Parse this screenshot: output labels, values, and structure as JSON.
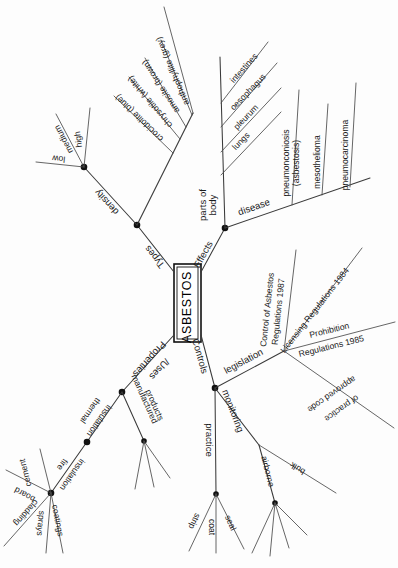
{
  "diagram": {
    "type": "mind-map",
    "title": "ASBESTOS",
    "orientation_note": "rotated-90-clockwise",
    "center": {
      "label": "ASBESTOS"
    },
    "main_branches": [
      {
        "id": "types",
        "label": "Types"
      },
      {
        "id": "effects",
        "label": "Effects"
      },
      {
        "id": "properties",
        "label": "Properties\n/Uses"
      },
      {
        "id": "controls",
        "label": "Controls"
      }
    ],
    "labels": {
      "types": "Types",
      "effects": "Effects",
      "properties_line1": "Properties",
      "properties_line2": "/Uses",
      "controls": "Controls",
      "density": "density",
      "low": "low",
      "medium": "medium",
      "high": "high",
      "crocidolite": "crocidolite (blue)",
      "chrysotile": "chrysotile (white)",
      "amosite": "amosite (brown)",
      "anthophyllite": "anthophyllite (grey)",
      "parts_of_body_line1": "parts of",
      "parts_of_body_line2": "body",
      "intestines": "intestines",
      "oesophagus": "oesophagus",
      "pleurum": "pleurum",
      "lungs": "lungs",
      "disease": "disease",
      "pneumonconiosis_line1": "pneumonconiosis",
      "pneumonconiosis_line2": "(asbestosis)",
      "mesothelioma": "mesothelioma",
      "pneumocarcinoma": "pneumocarcinoma",
      "legislation": "legislation",
      "control_of_asbestos_line1": "Control of Asbestos",
      "control_of_asbestos_line2": "Regulations 1987",
      "licensing_regulations": "Licensing Regulations 1984",
      "prohibition": "Prohibition",
      "regulations_1985": "Regulations 1985",
      "approved_code_line1": "approved code",
      "approved_code_line2": "of practice",
      "practice": "practice",
      "strip": "strip",
      "coat": "coat",
      "seal": "seal",
      "monitoring": "monitoring",
      "airborne": "airborne",
      "bulk": "bulk",
      "thermal_insulation_line1": "thermal",
      "thermal_insulation_line2": "insulation",
      "fire_insulation_line1": "fire",
      "fire_insulation_line2": "insulation",
      "cement": "cement",
      "board": "board",
      "cladding": "cladding",
      "sprays": "sprays",
      "coatings": "coatings",
      "manufactured_line1": "manufactured",
      "manufactured_line2": "products"
    },
    "tree": {
      "Types": {
        "density": [
          "low",
          "medium",
          "high"
        ],
        "fibre_types": [
          "crocidolite (blue)",
          "chrysotile (white)",
          "amosite (brown)",
          "anthophyllite (grey)"
        ]
      },
      "Effects": {
        "parts of body": [
          "intestines",
          "oesophagus",
          "pleurum",
          "lungs"
        ],
        "disease": [
          "pneumonconiosis (asbestosis)",
          "mesothelioma",
          "pneumocarcinoma"
        ]
      },
      "Properties /Uses": {
        "thermal insulation": [],
        "fire insulation": [
          "cement",
          "board",
          "cladding",
          "sprays",
          "coatings"
        ],
        "manufactured products": [
          "",
          "",
          ""
        ]
      },
      "Controls": {
        "legislation": [
          "Control of Asbestos Regulations 1987",
          "Licensing Regulations 1984",
          "Prohibition Regulations 1985",
          "approved code of practice"
        ],
        "practice": [
          "strip",
          "coat",
          "seal"
        ],
        "monitoring": {
          "airborne": [
            "",
            "",
            "",
            ""
          ],
          "bulk": []
        }
      }
    },
    "colors": {
      "background": "#fdfdfd",
      "stroke": "#3a3a3a",
      "text": "#1a1a1a",
      "node": "#111111"
    }
  }
}
